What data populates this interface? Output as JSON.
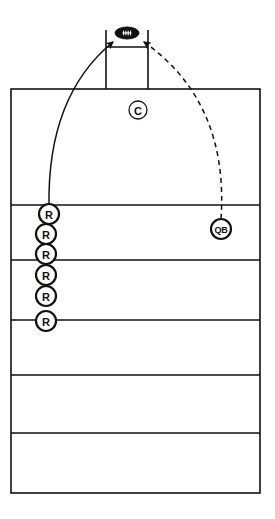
{
  "diagram": {
    "background_color": "#ffffff",
    "line_color": "#111111",
    "marker_fill": "#ffffff",
    "marker_stroke": "#111111",
    "football_color": "#111111"
  },
  "field": {
    "name": "field-area",
    "left": 11,
    "top": 89,
    "right": 260,
    "bottom": 493,
    "border_width": 1.6,
    "yard_lines": [
      {
        "name": "yard-line-1",
        "y": 205
      },
      {
        "name": "yard-line-2",
        "y": 260
      },
      {
        "name": "yard-line-3",
        "y": 320
      },
      {
        "name": "yard-line-4",
        "y": 375
      },
      {
        "name": "yard-line-5",
        "y": 433
      }
    ],
    "yard_line_width": 1.4
  },
  "uprights": {
    "name": "goal-post-uprights",
    "left_post_x": 106,
    "right_post_x": 148,
    "top_y": 30,
    "bottom_y": 89,
    "crossbar_y": 47,
    "stroke_width": 1.6
  },
  "football": {
    "name": "football-icon",
    "label": "football",
    "cx": 127,
    "cy": 33,
    "rx": 12,
    "ry": 6,
    "lace_count": 4
  },
  "arrows": [
    {
      "name": "receiver-route-arrow",
      "label": "R route (solid)",
      "style": "solid",
      "from": {
        "x": 49,
        "y": 207
      },
      "to": {
        "x": 113,
        "y": 42
      },
      "control": {
        "x": 47,
        "y": 96
      },
      "stroke_width": 1.5,
      "arrowhead": "filled"
    },
    {
      "name": "quarterback-pass-arrow",
      "label": "QB pass (dashed)",
      "style": "dashed",
      "from": {
        "x": 221,
        "y": 219
      },
      "to": {
        "x": 144,
        "y": 42
      },
      "control": {
        "x": 229,
        "y": 102
      },
      "stroke_width": 1.5,
      "dash_pattern": "5,4",
      "arrowhead": "filled"
    }
  ],
  "players": [
    {
      "name": "player-marker-r-1",
      "label": "R",
      "role": "receiver",
      "cx": 49,
      "cy": 214,
      "r": 10,
      "stroke_width": 2.2,
      "font_class": "lbl-r"
    },
    {
      "name": "player-marker-r-2",
      "label": "R",
      "role": "receiver",
      "cx": 46,
      "cy": 234,
      "r": 10,
      "stroke_width": 2.2,
      "font_class": "lbl-r"
    },
    {
      "name": "player-marker-r-3",
      "label": "R",
      "role": "receiver",
      "cx": 46,
      "cy": 254,
      "r": 10,
      "stroke_width": 2.2,
      "font_class": "lbl-r"
    },
    {
      "name": "player-marker-r-4",
      "label": "R",
      "role": "receiver",
      "cx": 46,
      "cy": 275,
      "r": 10,
      "stroke_width": 2.2,
      "font_class": "lbl-r"
    },
    {
      "name": "player-marker-r-5",
      "label": "R",
      "role": "receiver",
      "cx": 46,
      "cy": 296,
      "r": 10,
      "stroke_width": 2.2,
      "font_class": "lbl-r"
    },
    {
      "name": "player-marker-r-6",
      "label": "R",
      "role": "receiver",
      "cx": 46,
      "cy": 321,
      "r": 10,
      "stroke_width": 2.2,
      "font_class": "lbl-r"
    },
    {
      "name": "player-marker-qb",
      "label": "QB",
      "role": "quarterback",
      "cx": 221,
      "cy": 229,
      "r": 10,
      "stroke_width": 2.2,
      "font_class": "lbl-qb"
    },
    {
      "name": "player-marker-c",
      "label": "C",
      "role": "center",
      "cx": 138,
      "cy": 110,
      "r": 9,
      "stroke_width": 1.3,
      "font_class": "lbl-c"
    }
  ]
}
